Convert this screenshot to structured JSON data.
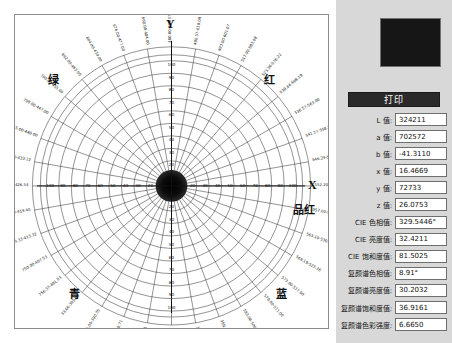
{
  "panel": {
    "print_label": "打印",
    "swatch_color": "#161616"
  },
  "fields": [
    {
      "label": "L 值:",
      "value": "324211"
    },
    {
      "label": "a 值:",
      "value": "702572"
    },
    {
      "label": "b 值:",
      "value": "-41.3110"
    },
    {
      "label": "x 值:",
      "value": "16.4669"
    },
    {
      "label": "y 值:",
      "value": "72733"
    },
    {
      "label": "z 值:",
      "value": "26.0753"
    },
    {
      "label": "CIE 色相值:",
      "value": "329.5446°"
    },
    {
      "label": "CIE 亮度值:",
      "value": "32.4211"
    },
    {
      "label": "CIE 饱和度值:",
      "value": "81.5025"
    },
    {
      "label": "复颜谱色相值:",
      "value": "8.91°"
    },
    {
      "label": "复颜谱亮度值:",
      "value": "30.2032"
    },
    {
      "label": "复颜谱饱和度值:",
      "value": "36.9161"
    },
    {
      "label": "复颜谱色彩强度:",
      "value": "6.6650"
    }
  ],
  "chart_data": {
    "type": "polar",
    "title": "",
    "axis_x_label": "X",
    "axis_y_label": "Y",
    "quadrant_labels": [
      {
        "name": "绿",
        "position": "upper-left"
      },
      {
        "name": "红",
        "position": "upper-right"
      },
      {
        "name": "品红",
        "position": "right"
      },
      {
        "name": "蓝",
        "position": "lower-right"
      },
      {
        "name": "青",
        "position": "lower-left"
      }
    ],
    "radial_ticks": [
      10,
      20,
      30,
      40,
      50,
      60,
      70,
      80,
      90,
      100
    ],
    "radial_max": 100,
    "angular_divisions": 36,
    "angular_step_deg": 10,
    "grid": true,
    "center_marker": "dark-disc",
    "outer_ring_labels": [
      "480.00-623.57",
      "486.57-610.09",
      "493.00-601.07",
      "517.90-583.08",
      "523.36-576.22",
      "530.64-568.19",
      "536.57-563.00",
      "541.17-558.25",
      "546.29-552.67",
      "552.20-543.54",
      "557.00-537.00",
      "563.19-530.02",
      "568.19-523.36",
      "573.00-517.90",
      "578.00-511.00",
      "583.08-506.00",
      "589.53-500.00",
      "594.67-493.00",
      "594.00-486.57",
      "594.67-759.61",
      "594.00-780.71",
      "766.00-390.35",
      "33.00-395.85",
      "756.37-401.53",
      "750.00-407.53",
      "743.33-413.32",
      "735.00-419.40",
      "728.51-426.54",
      "722.00-433.12",
      "715.00-440.00",
      "708.00-447.00",
      "700.00-455.00",
      "692.00-463.00",
      "684.00-470.00",
      "676.00-477.00",
      "668.00-484.00"
    ]
  }
}
